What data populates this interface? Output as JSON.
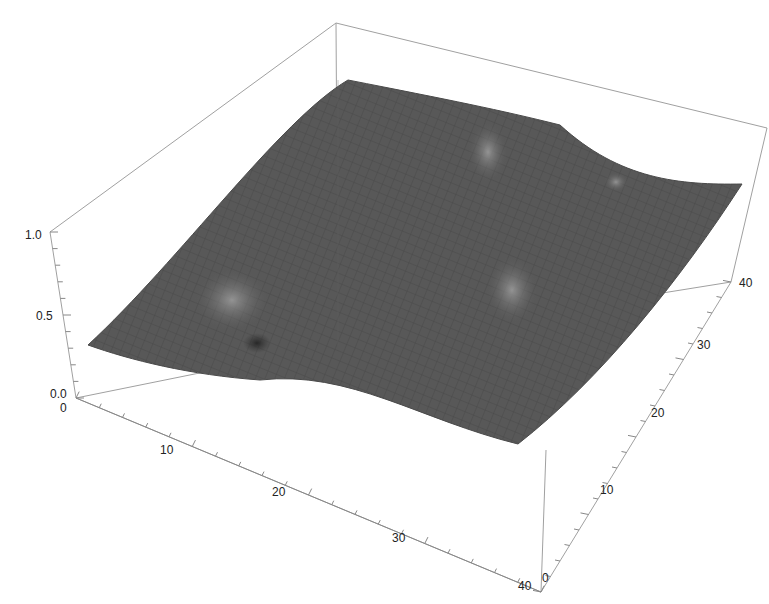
{
  "chart_data": {
    "type": "surface3d",
    "title": "",
    "xlabel": "",
    "ylabel": "",
    "zlabel": "",
    "x_ticks": [
      "0",
      "10",
      "20",
      "30",
      "40"
    ],
    "y_ticks": [
      "0",
      "10",
      "20",
      "30",
      "40"
    ],
    "z_ticks": [
      "0.0",
      "0.5",
      "1.0"
    ],
    "x_range": [
      0,
      40
    ],
    "y_range": [
      0,
      40
    ],
    "z_range": [
      0,
      1
    ],
    "grid_mesh": true,
    "surface_color": "#555555",
    "box_color": "#999999",
    "surface_corners_z": {
      "x0_y0": 0.3,
      "x40_y0": 0.3,
      "x40_y40": 0.75,
      "x0_y40": 0.75
    },
    "features": [
      {
        "type": "peak",
        "x": 9,
        "y": 10,
        "z": 0.55,
        "note": "peak with dark dip at base"
      },
      {
        "type": "peak",
        "x": 27,
        "y": 26,
        "z": 0.65
      },
      {
        "type": "peak",
        "x": 19,
        "y": 33,
        "z": 0.85
      },
      {
        "type": "bump",
        "x": 32,
        "y": 37,
        "z": 0.8
      }
    ]
  }
}
